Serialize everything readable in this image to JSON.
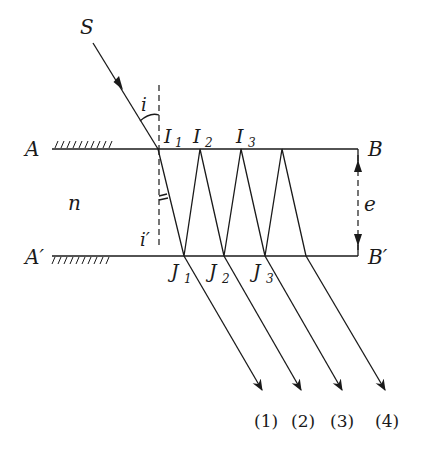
{
  "diagram": {
    "title": "",
    "labels": {
      "source": "S",
      "incidence_angle": "i",
      "refraction_angle": "i′",
      "top_left": "A",
      "bottom_left": "A′",
      "top_right": "B",
      "bottom_right": "B′",
      "index": "n",
      "thickness": "e",
      "I1": "I",
      "I1_sub": "1",
      "I2": "I",
      "I2_sub": "2",
      "I3": "I",
      "I3_sub": "3",
      "J1": "J",
      "J1_sub": "1",
      "J2": "J",
      "J2_sub": "2",
      "J3": "J",
      "J3_sub": "3"
    },
    "outputs": [
      "(1)",
      "(2)",
      "(3)",
      "(4)"
    ],
    "colors": {
      "stroke": "#1a1a1a",
      "background": "#ffffff"
    }
  }
}
